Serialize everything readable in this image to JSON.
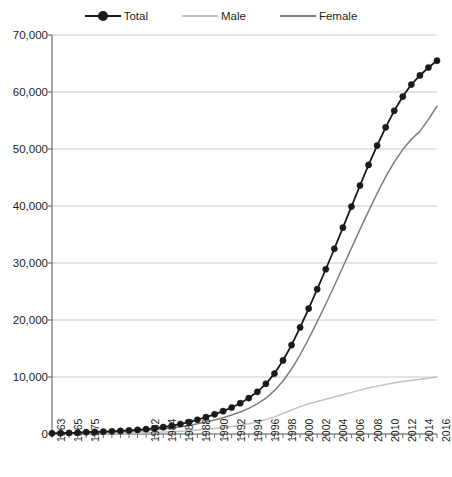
{
  "legend": {
    "position": "top-center",
    "entries": [
      {
        "label": "Total",
        "color": "#1a1a1a",
        "marker": "circle-marker",
        "icon": "legend-line-marker-icon"
      },
      {
        "label": "Male",
        "color": "#c2c2c2",
        "marker": "none",
        "icon": "legend-line-icon"
      },
      {
        "label": "Female",
        "color": "#7d7d7d",
        "marker": "none",
        "icon": "legend-line-icon"
      }
    ]
  },
  "axes": {
    "y_ticks": [
      "70,000",
      "60,000",
      "50,000",
      "40,000",
      "30,000",
      "20,000",
      "10,000",
      "0"
    ],
    "x_ticks": [
      "1963",
      "1965",
      "1975",
      "1982",
      "1984",
      "1986",
      "1988",
      "1990",
      "1992",
      "1994",
      "1996",
      "1998",
      "2000",
      "2002",
      "2004",
      "2006",
      "2008",
      "2010",
      "2012",
      "2014",
      "2016"
    ]
  },
  "colors": {
    "total": "#1a1a1a",
    "male": "#c2c2c2",
    "female": "#7d7d7d",
    "gridline": "#c9c9c9",
    "axis": "#6e6e6e",
    "text": "#231f20",
    "background": "#ffffff"
  },
  "chart_data": {
    "type": "line",
    "title": "",
    "subtitle": "",
    "xlabel": "",
    "ylabel": "",
    "ylim": [
      0,
      70000
    ],
    "ytick_step": 10000,
    "grid": true,
    "legend_position": "top-center",
    "x_axis_kind": "categorical",
    "categories": [
      "1963",
      "1964",
      "1965",
      "1966",
      "1975",
      "1976",
      "1977",
      "1978",
      "1979",
      "1980",
      "1981",
      "1982",
      "1983",
      "1984",
      "1985",
      "1986",
      "1987",
      "1988",
      "1989",
      "1990",
      "1991",
      "1992",
      "1993",
      "1994",
      "1995",
      "1996",
      "1997",
      "1998",
      "1999",
      "2000",
      "2001",
      "2002",
      "2003",
      "2004",
      "2005",
      "2006",
      "2007",
      "2008",
      "2009",
      "2010",
      "2011",
      "2012",
      "2013",
      "2014",
      "2015",
      "2016"
    ],
    "tick_labels_shown": [
      "1963",
      "",
      "1965",
      "",
      "1975",
      "",
      "",
      "",
      "",
      "",
      "",
      "1982",
      "",
      "1984",
      "",
      "1986",
      "",
      "1988",
      "",
      "1990",
      "",
      "1992",
      "",
      "1994",
      "",
      "1996",
      "",
      "1998",
      "",
      "2000",
      "",
      "2002",
      "",
      "2004",
      "",
      "2006",
      "",
      "2008",
      "",
      "2010",
      "",
      "2012",
      "",
      "2014",
      "",
      "2016"
    ],
    "series": [
      {
        "name": "Total",
        "color": "#1a1a1a",
        "marker": "circle",
        "values": [
          120,
          150,
          190,
          230,
          320,
          360,
          410,
          470,
          540,
          620,
          720,
          850,
          1000,
          1200,
          1450,
          1750,
          2100,
          2500,
          2950,
          3450,
          4000,
          4650,
          5400,
          6300,
          7400,
          8800,
          10600,
          12900,
          15600,
          18700,
          22000,
          25400,
          28900,
          32500,
          36200,
          39900,
          43600,
          47200,
          50600,
          53800,
          56700,
          59200,
          61300,
          62900,
          64300,
          65500
        ]
      },
      {
        "name": "Female",
        "color": "#7d7d7d",
        "values": [
          90,
          110,
          140,
          170,
          240,
          270,
          310,
          350,
          400,
          460,
          530,
          620,
          730,
          870,
          1050,
          1260,
          1510,
          1790,
          2110,
          2470,
          2860,
          3320,
          3860,
          4500,
          5280,
          6280,
          7600,
          9300,
          11400,
          13900,
          16700,
          19700,
          22800,
          26000,
          29300,
          32600,
          35900,
          39100,
          42200,
          45100,
          47700,
          49900,
          51700,
          53100,
          55200,
          57500
        ]
      },
      {
        "name": "Male",
        "color": "#c2c2c2",
        "values": [
          30,
          40,
          50,
          60,
          80,
          90,
          100,
          120,
          140,
          160,
          190,
          230,
          270,
          330,
          400,
          490,
          590,
          710,
          840,
          980,
          1140,
          1330,
          1540,
          1800,
          2120,
          2520,
          3000,
          3600,
          4200,
          4800,
          5300,
          5700,
          6100,
          6500,
          6900,
          7300,
          7700,
          8100,
          8400,
          8700,
          9000,
          9200,
          9400,
          9600,
          9800,
          10000
        ]
      }
    ],
    "annotations": []
  },
  "geometry": {
    "plot_left": 52,
    "plot_right": 437,
    "plot_top": 35,
    "plot_bottom": 434
  }
}
